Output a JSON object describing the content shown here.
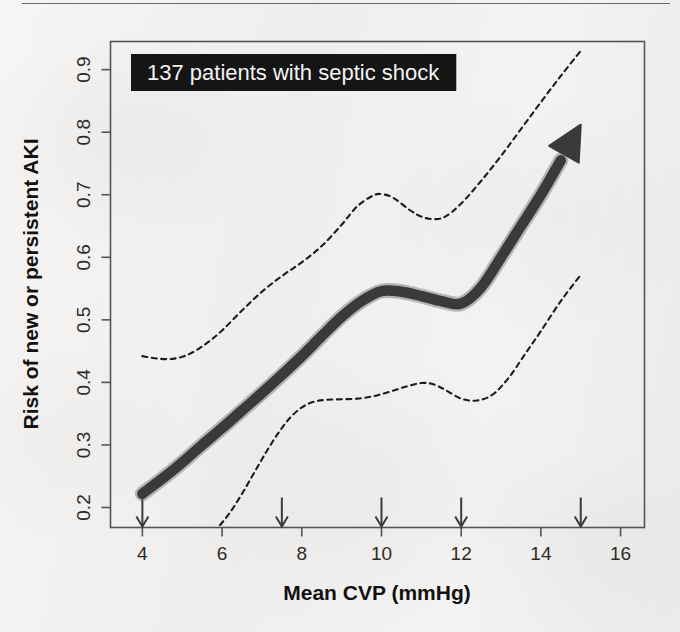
{
  "page": {
    "background_color": "#f2f1ef",
    "has_top_rule": true
  },
  "annotation": {
    "text": "137 patients with septic shock",
    "background_color": "#151515",
    "text_color": "#f3f3f3"
  },
  "chart_data": {
    "type": "line",
    "title": "",
    "xlabel": "Mean CVP (mmHg)",
    "ylabel": "Risk of new or persistent AKI",
    "xlim": [
      3.2,
      16.6
    ],
    "ylim": [
      0.168,
      0.945
    ],
    "xticks": [
      4,
      6,
      8,
      10,
      12,
      14,
      16
    ],
    "xtick_labels": [
      "4",
      "6",
      "8",
      "10",
      "12",
      "14",
      "16"
    ],
    "yticks": [
      0.2,
      0.3,
      0.4,
      0.5,
      0.6,
      0.7,
      0.8,
      0.9
    ],
    "ytick_labels": [
      "0.2",
      "0.3",
      "0.4",
      "0.5",
      "0.6",
      "0.7",
      "0.8",
      "0.9"
    ],
    "grid": false,
    "legend": "none",
    "knot_arrows_x": [
      4,
      7.5,
      10,
      12,
      15
    ],
    "series": [
      {
        "name": "Predicted risk",
        "style": "thick-solid-arrow",
        "color": "#3a3a3a",
        "x": [
          4.0,
          4.5,
          5.0,
          5.5,
          6.0,
          6.5,
          7.0,
          7.5,
          8.0,
          8.5,
          9.0,
          9.5,
          10.0,
          10.5,
          11.0,
          11.5,
          12.0,
          12.5,
          13.0,
          13.5,
          14.0,
          14.5,
          15.0
        ],
        "y": [
          0.222,
          0.246,
          0.272,
          0.3,
          0.327,
          0.355,
          0.383,
          0.412,
          0.442,
          0.474,
          0.505,
          0.53,
          0.546,
          0.545,
          0.538,
          0.53,
          0.526,
          0.552,
          0.6,
          0.65,
          0.7,
          0.755,
          0.812
        ]
      },
      {
        "name": "Upper 95% confidence limit",
        "style": "dashed",
        "color": "#1d1d1d",
        "x": [
          4.0,
          4.4,
          4.8,
          5.2,
          5.6,
          6.0,
          6.5,
          7.0,
          7.5,
          8.0,
          8.5,
          9.0,
          9.4,
          9.8,
          10.0,
          10.3,
          10.7,
          11.0,
          11.3,
          11.6,
          12.0,
          12.5,
          13.0,
          13.5,
          14.0,
          14.5,
          15.0
        ],
        "y": [
          0.442,
          0.438,
          0.438,
          0.446,
          0.462,
          0.483,
          0.515,
          0.545,
          0.57,
          0.592,
          0.618,
          0.652,
          0.682,
          0.699,
          0.701,
          0.695,
          0.676,
          0.665,
          0.661,
          0.665,
          0.686,
          0.722,
          0.762,
          0.805,
          0.848,
          0.89,
          0.93
        ]
      },
      {
        "name": "Lower 95% confidence limit",
        "style": "dashed",
        "color": "#1d1d1d",
        "x": [
          5.95,
          6.2,
          6.5,
          6.8,
          7.1,
          7.4,
          7.7,
          8.0,
          8.3,
          8.6,
          9.0,
          9.4,
          9.8,
          10.2,
          10.6,
          11.0,
          11.3,
          11.6,
          12.0,
          12.4,
          12.8,
          13.2,
          13.6,
          14.0,
          14.5,
          15.0
        ],
        "y": [
          0.172,
          0.192,
          0.222,
          0.255,
          0.288,
          0.318,
          0.343,
          0.36,
          0.369,
          0.372,
          0.373,
          0.374,
          0.378,
          0.385,
          0.393,
          0.399,
          0.397,
          0.388,
          0.374,
          0.371,
          0.381,
          0.408,
          0.445,
          0.482,
          0.53,
          0.572
        ]
      }
    ]
  }
}
